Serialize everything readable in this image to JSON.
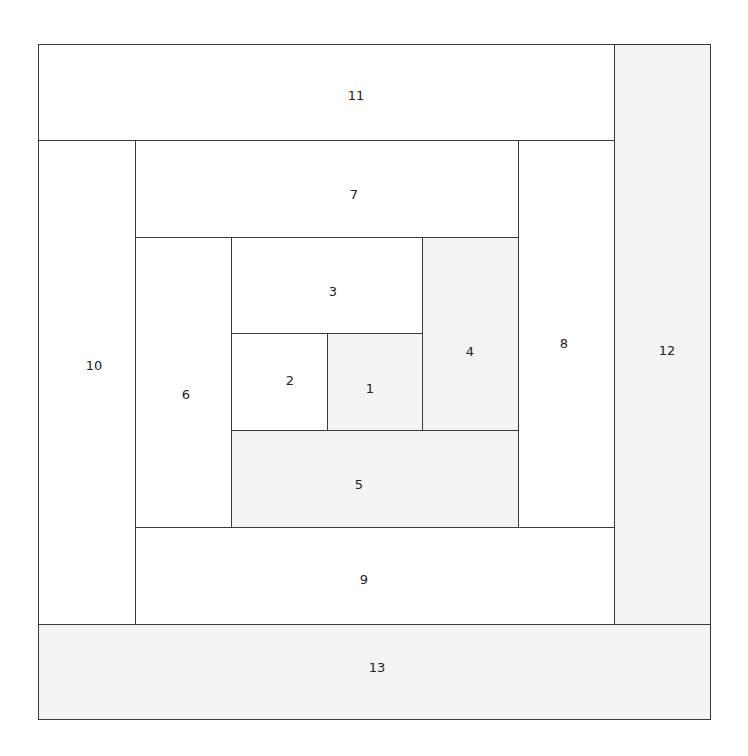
{
  "diagram": {
    "title": "",
    "colors": {
      "line": "#3a3a3a",
      "white": "#ffffff",
      "gray": "#f3f3f3"
    },
    "blocks": [
      {
        "id": "1",
        "x": 327,
        "y": 333,
        "w": 95,
        "h": 97,
        "fill": "gray",
        "lx": 370,
        "ly": 388
      },
      {
        "id": "2",
        "x": 231,
        "y": 333,
        "w": 96,
        "h": 97,
        "fill": "white",
        "lx": 290,
        "ly": 380
      },
      {
        "id": "3",
        "x": 231,
        "y": 237,
        "w": 191,
        "h": 96,
        "fill": "white",
        "lx": 333,
        "ly": 291
      },
      {
        "id": "4",
        "x": 422,
        "y": 237,
        "w": 96,
        "h": 193,
        "fill": "gray",
        "lx": 470,
        "ly": 351
      },
      {
        "id": "5",
        "x": 231,
        "y": 430,
        "w": 287,
        "h": 97,
        "fill": "gray",
        "lx": 359,
        "ly": 484
      },
      {
        "id": "6",
        "x": 135,
        "y": 237,
        "w": 96,
        "h": 290,
        "fill": "white",
        "lx": 186,
        "ly": 394
      },
      {
        "id": "7",
        "x": 135,
        "y": 140,
        "w": 383,
        "h": 97,
        "fill": "white",
        "lx": 354,
        "ly": 194
      },
      {
        "id": "8",
        "x": 518,
        "y": 140,
        "w": 96,
        "h": 387,
        "fill": "white",
        "lx": 564,
        "ly": 343
      },
      {
        "id": "9",
        "x": 135,
        "y": 527,
        "w": 479,
        "h": 97,
        "fill": "white",
        "lx": 364,
        "ly": 579
      },
      {
        "id": "10",
        "x": 38,
        "y": 140,
        "w": 97,
        "h": 484,
        "fill": "white",
        "lx": 94,
        "ly": 365
      },
      {
        "id": "11",
        "x": 38,
        "y": 44,
        "w": 576,
        "h": 96,
        "fill": "white",
        "lx": 356,
        "ly": 95
      },
      {
        "id": "12",
        "x": 614,
        "y": 44,
        "w": 96,
        "h": 580,
        "fill": "gray",
        "lx": 667,
        "ly": 350
      },
      {
        "id": "13",
        "x": 38,
        "y": 624,
        "w": 672,
        "h": 95,
        "fill": "gray",
        "lx": 377,
        "ly": 667
      }
    ]
  }
}
